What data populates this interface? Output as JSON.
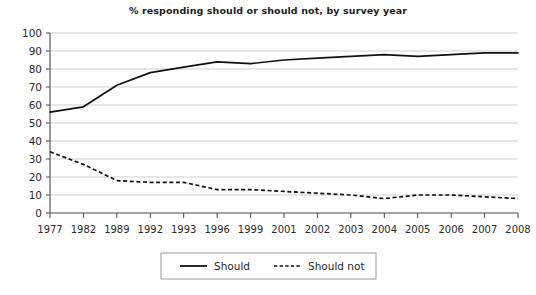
{
  "chart_data": {
    "type": "line",
    "title": "% responding should or should not, by survey year",
    "xlabel": "",
    "ylabel": "",
    "ylim": [
      0,
      100
    ],
    "ytick_step": 10,
    "yticks": [
      0,
      10,
      20,
      30,
      40,
      50,
      60,
      70,
      80,
      90,
      100
    ],
    "grid": true,
    "legend_position": "bottom",
    "categories": [
      "1977",
      "1982",
      "1989",
      "1992",
      "1993",
      "1996",
      "1999",
      "2001",
      "2002",
      "2003",
      "2004",
      "2005",
      "2006",
      "2007",
      "2008"
    ],
    "series": [
      {
        "name": "Should",
        "style": "solid",
        "color": "#111111",
        "values": [
          56,
          59,
          71,
          78,
          81,
          84,
          83,
          85,
          86,
          87,
          88,
          87,
          88,
          89,
          89
        ]
      },
      {
        "name": "Should not",
        "style": "dashed",
        "color": "#111111",
        "values": [
          34,
          27,
          18,
          17,
          17,
          13,
          13,
          12,
          11,
          10,
          8,
          10,
          10,
          9,
          8
        ]
      }
    ]
  },
  "legend": {
    "items": [
      {
        "label": "Should",
        "style": "solid"
      },
      {
        "label": "Should not",
        "style": "dashed"
      }
    ]
  }
}
